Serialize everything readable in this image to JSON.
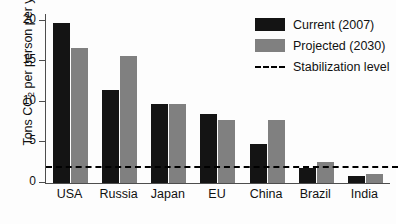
{
  "chart_data": {
    "type": "bar",
    "title": "",
    "xlabel": "",
    "ylabel": "Tons CO2 per person per year",
    "ylabel_prefix": "Tons CO",
    "ylabel_sub": "2",
    "ylabel_suffix": " per person per year",
    "ylim": [
      0,
      20.8
    ],
    "yticks": [
      0,
      5,
      10,
      15,
      20
    ],
    "ytick_labels": [
      "0",
      "5",
      "10",
      "15",
      "20"
    ],
    "grid": false,
    "legend_position": "top-right",
    "categories": [
      "USA",
      "Russia",
      "Japan",
      "EU",
      "China",
      "Brazil",
      "India"
    ],
    "series": [
      {
        "name": "Current (2007)",
        "color": "#141414",
        "values": [
          19.7,
          11.5,
          9.7,
          8.5,
          4.8,
          1.8,
          0.9
        ]
      },
      {
        "name": "Projected (2030)",
        "color": "#808080",
        "values": [
          16.6,
          15.6,
          9.7,
          7.7,
          7.8,
          2.6,
          1.1
        ]
      }
    ],
    "annotations": [
      {
        "name": "Stabilization level",
        "type": "hline",
        "value": 1.8,
        "style": "dashed",
        "color": "#000000"
      }
    ]
  },
  "legend": {
    "items": [
      {
        "label": "Current (2007)",
        "swatch": "current"
      },
      {
        "label": "Projected (2030)",
        "swatch": "projected"
      },
      {
        "label": "Stabilization level",
        "swatch": "dashed"
      }
    ]
  }
}
